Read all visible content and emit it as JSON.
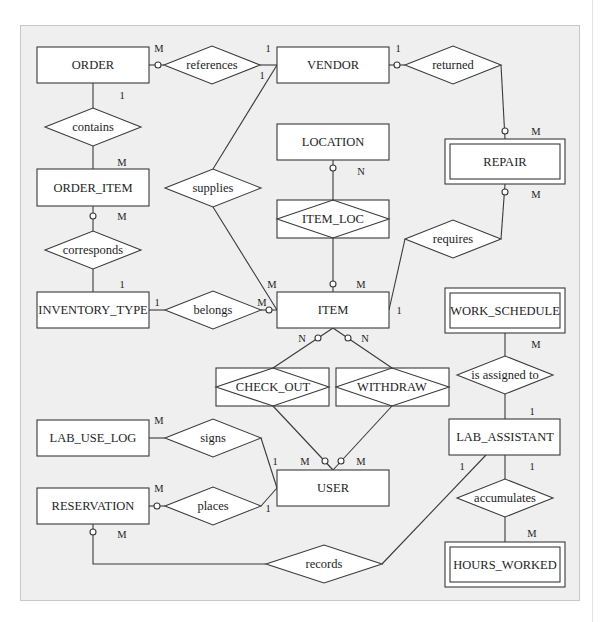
{
  "diagram": {
    "type": "entity-relationship",
    "entities": {
      "order": "ORDER",
      "vendor": "VENDOR",
      "location": "LOCATION",
      "repair": "REPAIR",
      "order_item": "ORDER_ITEM",
      "inventory_type": "INVENTORY_TYPE",
      "item": "ITEM",
      "work_schedule": "WORK_SCHEDULE",
      "lab_use_log": "LAB_USE_LOG",
      "lab_assistant": "LAB_ASSISTANT",
      "user": "USER",
      "reservation": "RESERVATION",
      "hours_worked": "HOURS_WORKED"
    },
    "weak_entities": [
      "REPAIR",
      "WORK_SCHEDULE",
      "HOURS_WORKED"
    ],
    "relationships": {
      "references": "references",
      "returned": "returned",
      "contains": "contains",
      "supplies": "supplies",
      "item_loc": "ITEM_LOC",
      "requires": "requires",
      "corresponds": "corresponds",
      "belongs": "belongs",
      "check_out": "CHECK_OUT",
      "withdraw": "WITHDRAW",
      "is_assigned_to": "is assigned to",
      "signs": "signs",
      "places": "places",
      "accumulates": "accumulates",
      "records": "records"
    },
    "associative_entities": [
      "ITEM_LOC",
      "CHECK_OUT",
      "WITHDRAW"
    ],
    "cardinalities": {
      "order_references": "M",
      "vendor_references": "1",
      "vendor_supplies": "1",
      "vendor_returned": "1",
      "order_contains": "1",
      "order_item_contains": "M",
      "repair_returned": "M",
      "location_item_loc": "N",
      "repair_requires": "M",
      "order_item_corresponds": "M",
      "inventory_type_corresponds": "1",
      "item_supplies": "M",
      "item_item_loc": "M",
      "inventory_type_belongs": "1",
      "item_belongs": "M",
      "item_requires": "1",
      "work_schedule_assigned": "M",
      "item_check_out": "N",
      "item_withdraw": "N",
      "lab_assistant_assigned": "1",
      "lab_use_log_signs": "M",
      "user_signs": "1",
      "user_check_out": "M",
      "user_withdraw": "M",
      "lab_assistant_records": "1",
      "lab_assistant_accumulates": "1",
      "reservation_places": "M",
      "user_places": "1",
      "reservation_records": "M",
      "hours_worked_accumulates": "M"
    }
  }
}
